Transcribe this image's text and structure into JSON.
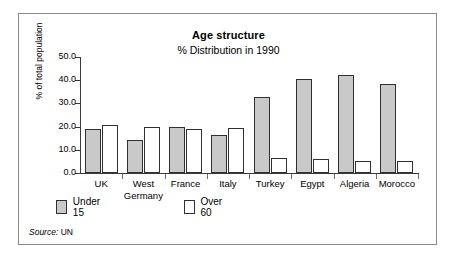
{
  "chart_data": {
    "type": "bar",
    "title": "Age structure",
    "subtitle": "% Distribution in 1990",
    "xlabel": "",
    "ylabel": "% of total population",
    "ylim": [
      0.0,
      50.0
    ],
    "ytick_labels": [
      "0.0",
      "10.0",
      "20.0",
      "30.0",
      "40.0",
      "50.0"
    ],
    "ytick_values": [
      0.0,
      10.0,
      20.0,
      30.0,
      40.0,
      50.0
    ],
    "grid": false,
    "legend_position": "below-left",
    "categories": [
      "UK",
      "West Germany",
      "France",
      "Italy",
      "Turkey",
      "Egypt",
      "Algeria",
      "Morocco"
    ],
    "category_lines": [
      [
        "UK"
      ],
      [
        "West",
        "Germany"
      ],
      [
        "France"
      ],
      [
        "Italy"
      ],
      [
        "Turkey"
      ],
      [
        "Egypt"
      ],
      [
        "Algeria"
      ],
      [
        "Morocco"
      ]
    ],
    "series": [
      {
        "name": "Under 15",
        "color": "#c9c9c9",
        "values": [
          19.0,
          14.2,
          19.7,
          16.5,
          32.6,
          40.4,
          42.2,
          38.2
        ]
      },
      {
        "name": "Over 60",
        "color": "#ffffff",
        "values": [
          20.7,
          19.8,
          18.8,
          19.6,
          6.4,
          6.2,
          5.2,
          5.1
        ]
      }
    ]
  },
  "legend": {
    "items": [
      {
        "label": "Under 15",
        "swatch": "under15"
      },
      {
        "label": "Over 60",
        "swatch": "over60"
      }
    ]
  },
  "source": {
    "label": "Source:",
    "value": "UN"
  }
}
